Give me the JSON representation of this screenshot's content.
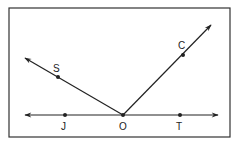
{
  "diagram": {
    "type": "geometry-rays-and-line",
    "frame": {
      "x": 9,
      "y": 8,
      "width": 221,
      "height": 129,
      "stroke": "#333333"
    },
    "line_color": "#222222",
    "vertex": {
      "label": "O",
      "x": 123,
      "y": 115
    },
    "line": {
      "name": "line JT",
      "from": {
        "x": 25,
        "y": 115
      },
      "to": {
        "x": 218,
        "y": 115
      },
      "points": [
        {
          "label": "J",
          "x": 65,
          "y": 115
        },
        {
          "label": "O",
          "x": 123,
          "y": 115
        },
        {
          "label": "T",
          "x": 180,
          "y": 115
        }
      ]
    },
    "rays": [
      {
        "name": "ray OS",
        "from": {
          "x": 123,
          "y": 115
        },
        "to": {
          "x": 25,
          "y": 58
        },
        "point": {
          "label": "S",
          "x": 58,
          "y": 77
        }
      },
      {
        "name": "ray OC",
        "from": {
          "x": 123,
          "y": 115
        },
        "to": {
          "x": 211,
          "y": 25
        },
        "point": {
          "label": "C",
          "x": 183,
          "y": 55
        }
      }
    ],
    "labels": {
      "S": "S",
      "C": "C",
      "J": "J",
      "O": "O",
      "T": "T"
    }
  }
}
